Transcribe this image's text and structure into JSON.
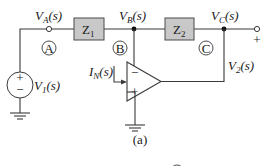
{
  "diagram": {
    "caption": "(a)",
    "nodes": {
      "A": {
        "label_main": "V",
        "label_sub": "A",
        "label_arg": "(s)",
        "marker": "A"
      },
      "B": {
        "label_main": "V",
        "label_sub": "B",
        "label_arg": "(s)",
        "marker": "B"
      },
      "C": {
        "label_main": "V",
        "label_sub": "C",
        "label_arg": "(s)",
        "marker": "C"
      }
    },
    "impedances": {
      "z1": {
        "main": "Z",
        "sub": "1"
      },
      "z2": {
        "main": "Z",
        "sub": "2"
      }
    },
    "source": {
      "main": "V",
      "sub": "1",
      "arg": "(s)",
      "plus": "+",
      "minus": "−"
    },
    "output": {
      "main": "V",
      "sub": "2",
      "arg": "(s)",
      "terminal_sign": "+"
    },
    "current": {
      "main": "I",
      "sub": "N",
      "arg": "(s)"
    },
    "opamp": {
      "inverting": "−",
      "noninverting": "+"
    },
    "colors": {
      "box_fill": "#c8c8c8",
      "wire": "#3a3a3a",
      "text": "#1a1a1a"
    }
  }
}
